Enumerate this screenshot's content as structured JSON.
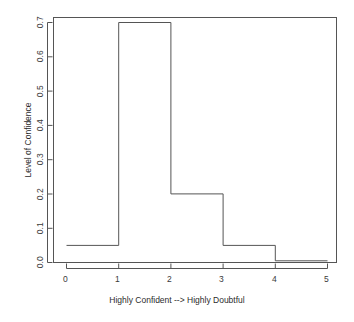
{
  "chart_data": {
    "type": "bar",
    "title": "",
    "subtitle": "",
    "xlabel": "Highly Confident --> Highly Doubtful",
    "ylabel": "Level of Confidence",
    "xlim": [
      0,
      5
    ],
    "ylim": [
      0.0,
      0.7
    ],
    "grid": false,
    "legend": null,
    "style": "step-outline-histogram",
    "bin_edges": [
      0,
      1,
      2,
      3,
      4,
      5
    ],
    "categories": [
      "0-1",
      "1-2",
      "2-3",
      "3-4",
      "4-5"
    ],
    "values": [
      0.05,
      0.7,
      0.2,
      0.05,
      0.005
    ],
    "xticks": [
      "0",
      "1",
      "2",
      "3",
      "4",
      "5"
    ],
    "xtick_values": [
      0,
      1,
      2,
      3,
      4,
      5
    ],
    "yticks": [
      "0.0",
      "0.1",
      "0.2",
      "0.3",
      "0.4",
      "0.5",
      "0.6",
      "0.7"
    ],
    "ytick_values": [
      0.0,
      0.1,
      0.2,
      0.3,
      0.4,
      0.5,
      0.6,
      0.7
    ],
    "line_color": "#555555",
    "background_color": "#ffffff",
    "box_color": "#555555"
  },
  "axes": {
    "x_title": "Highly Confident --> Highly Doubtful",
    "y_title": "Level of Confidence",
    "x_tick_labels": [
      "0",
      "1",
      "2",
      "3",
      "4",
      "5"
    ],
    "y_tick_labels": [
      "0.0",
      "0.1",
      "0.2",
      "0.3",
      "0.4",
      "0.5",
      "0.6",
      "0.7"
    ]
  }
}
